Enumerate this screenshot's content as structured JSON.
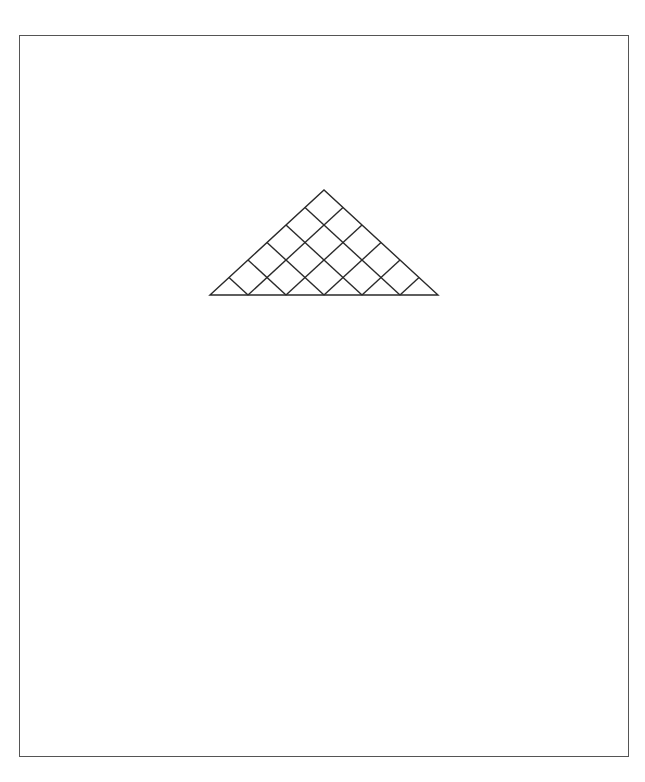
{
  "diagram": {
    "type": "house_of_quality",
    "labels": {
      "design_characteristics": [
        "Design",
        "characteristics",
        "(hows)"
      ],
      "customer_requirements": [
        "Customer",
        "requirements",
        "(wants)"
      ],
      "customer_importance": [
        "Customer",
        "importance",
        "rating"
      ],
      "target_values": [
        "Target values for",
        "design characteristics",
        "(how much)"
      ]
    },
    "correlation_key": {
      "title": "Correlation matrix key",
      "items": [
        {
          "symbol": "double-circle",
          "label": "Strong positive"
        },
        {
          "symbol": "circle",
          "label": "Positive"
        },
        {
          "symbol": "x",
          "label": "Negative"
        },
        {
          "symbol": "double-x",
          "label": "Strong negative"
        }
      ]
    },
    "relationship_key": {
      "title": "Relationship matrix key",
      "items": [
        {
          "symbol": "double-circle",
          "label": "Strong"
        },
        {
          "symbol": "circle",
          "label": "Moderate"
        },
        {
          "symbol": "triangle",
          "label": "Weak"
        }
      ]
    },
    "structure": {
      "design_columns": 6,
      "customer_rows": 5
    },
    "correlation_marks": [
      {
        "cols": [
          1,
          2
        ],
        "symbol": "circle"
      },
      {
        "cols": [
          2,
          4
        ],
        "symbol": "circle"
      },
      {
        "cols": [
          3,
          5
        ],
        "symbol": "x"
      },
      {
        "cols": [
          4,
          6
        ],
        "symbol": "double-circle"
      }
    ],
    "relationship_marks": [
      {
        "row": 1,
        "col": 1,
        "symbol": "triangle"
      },
      {
        "row": 1,
        "col": 3,
        "symbol": "circle"
      },
      {
        "row": 2,
        "col": 4,
        "symbol": "circle"
      },
      {
        "row": 4,
        "col": 1,
        "symbol": "double-circle"
      },
      {
        "row": 4,
        "col": 6,
        "symbol": "double-circle"
      },
      {
        "row": 5,
        "col": 5,
        "symbol": "triangle"
      }
    ]
  }
}
